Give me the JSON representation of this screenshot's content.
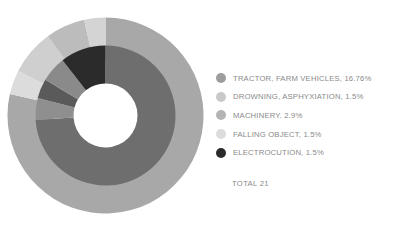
{
  "chart_data": {
    "type": "pie",
    "title": "",
    "subtitle": "",
    "xlabel": "",
    "ylabel": "",
    "legend_position": "right",
    "grid": false,
    "total_label": "TOTAL 21",
    "total_value": 21,
    "categories": [
      "TRACTOR, FARM VEHICLES",
      "DROWNING, ASPHYXIATION",
      "MACHINERY",
      "FALLING OBJECT",
      "ELECTROCUTION"
    ],
    "values": [
      16.76,
      1.5,
      2.9,
      1.5,
      1.5
    ],
    "value_unit": "%",
    "colors": [
      "#9d9d9d",
      "#c9c9c9",
      "#b4b4b4",
      "#dcdcdc",
      "#2b2b2b"
    ],
    "rings": [
      {
        "name": "outer",
        "inner_radius_px": 56,
        "outer_radius_px": 98,
        "segments": [
          {
            "label": "TRACTOR, FARM VEHICLES",
            "value": 78.5,
            "color": "#a8a8a8"
          },
          {
            "label": "FALLING OBJECT",
            "value": 4.0,
            "color": "#dcdcdc"
          },
          {
            "label": "DROWNING, ASPHYXIATION",
            "value": 7.5,
            "color": "#cfcfcf"
          },
          {
            "label": "MACHINERY",
            "value": 6.5,
            "color": "#bcbcbc"
          },
          {
            "label": "ELECTROCUTION",
            "value": 3.5,
            "color": "#d4d4d4"
          }
        ]
      },
      {
        "name": "inner",
        "inner_radius_px": 32,
        "outer_radius_px": 70,
        "segments": [
          {
            "label": "TRACTOR, FARM VEHICLES",
            "value": 74.0,
            "color": "#6e6e6e"
          },
          {
            "label": "MACHINERY",
            "value": 5.0,
            "color": "#8f8f8f"
          },
          {
            "label": "DROWNING, ASPHYXIATION",
            "value": 4.5,
            "color": "#5a5a5a"
          },
          {
            "label": "FALLING OBJECT",
            "value": 6.0,
            "color": "#8a8a8a"
          },
          {
            "label": "ELECTROCUTION",
            "value": 10.5,
            "color": "#2b2b2b"
          }
        ]
      }
    ]
  },
  "legend": {
    "items": [
      {
        "label": "TRACTOR, FARM VEHICLES, 16.76%",
        "color": "#9d9d9d"
      },
      {
        "label": "DROWNING, ASPHYXIATION, 1.5%",
        "color": "#c9c9c9"
      },
      {
        "label": "MACHINERY. 2.9%",
        "color": "#b4b4b4"
      },
      {
        "label": "FALLING OBJECT, 1.5%",
        "color": "#dcdcdc"
      },
      {
        "label": "ELECTROCUTION, 1.5%",
        "color": "#2b2b2b"
      }
    ]
  },
  "footer": {
    "total": "TOTAL 21"
  }
}
